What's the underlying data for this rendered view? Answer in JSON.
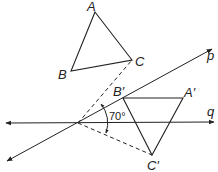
{
  "diagram": {
    "type": "geometry-rotation",
    "points": {
      "A": {
        "label": "A",
        "x": 95,
        "y": 12
      },
      "B": {
        "label": "B",
        "x": 71,
        "y": 71
      },
      "C": {
        "label": "C",
        "x": 132,
        "y": 60
      },
      "A'": {
        "label": "A′",
        "x": 183,
        "y": 98
      },
      "B'": {
        "label": "B′",
        "x": 123,
        "y": 98
      },
      "C'": {
        "label": "C′",
        "x": 152,
        "y": 155
      },
      "O": {
        "x": 78,
        "y": 123
      }
    },
    "lines": {
      "p": {
        "label": "p"
      },
      "q": {
        "label": "q"
      }
    },
    "angle": {
      "label": "70°"
    },
    "colors": {
      "stroke": "#222222",
      "background": "#ffffff"
    }
  }
}
